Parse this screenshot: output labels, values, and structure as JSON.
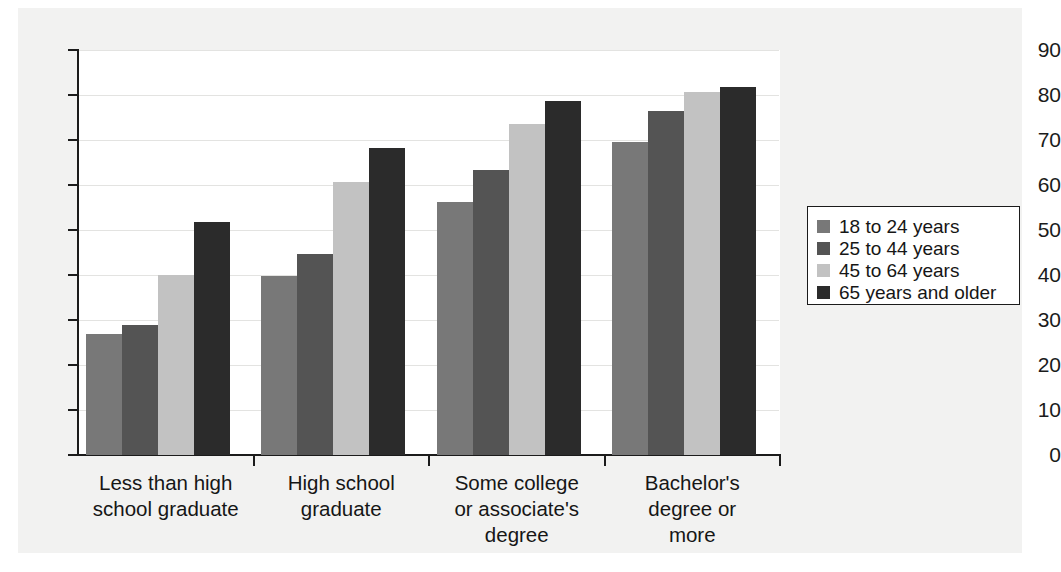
{
  "chart_data": {
    "type": "bar",
    "title": "",
    "subtitle": "",
    "xlabel": "",
    "ylabel": "",
    "ylim": [
      0,
      90
    ],
    "yticks": [
      0,
      10,
      20,
      30,
      40,
      50,
      60,
      70,
      80,
      90
    ],
    "ytick_labels": [
      "0",
      "10",
      "20",
      "30",
      "40",
      "50",
      "60",
      "70",
      "80",
      "90"
    ],
    "grid": true,
    "legend_position": "right",
    "categories": [
      "Less than high\nschool graduate",
      "High school\ngraduate",
      "Some college\nor associate's\ndegree",
      "Bachelor's\ndegree or\nmore"
    ],
    "category_lines": [
      [
        "Less than high",
        "school graduate"
      ],
      [
        "High school",
        "graduate"
      ],
      [
        "Some college",
        "or associate's",
        "degree"
      ],
      [
        "Bachelor's",
        "degree or",
        "more"
      ]
    ],
    "series": [
      {
        "name": "18 to 24 years",
        "color": "#787878",
        "values": [
          26.8,
          39.8,
          56.2,
          69.6
        ]
      },
      {
        "name": "25 to 44 years",
        "color": "#545454",
        "values": [
          29.0,
          44.7,
          63.3,
          76.5
        ]
      },
      {
        "name": "45 to 64 years",
        "color": "#c2c2c2",
        "values": [
          40.1,
          60.6,
          73.5,
          80.6
        ]
      },
      {
        "name": "65 years and older",
        "color": "#2b2b2b",
        "values": [
          51.7,
          68.2,
          78.7,
          81.7
        ]
      }
    ]
  },
  "legend": {
    "items": [
      {
        "label": "18 to 24 years",
        "color": "#787878"
      },
      {
        "label": "25 to 44 years",
        "color": "#545454"
      },
      {
        "label": "45 to 64 years",
        "color": "#c2c2c2"
      },
      {
        "label": "65 years and older",
        "color": "#2b2b2b"
      }
    ]
  },
  "colors": {
    "page_background": "#ffffff",
    "panel_background": "#f2f2f1",
    "plot_background": "#ffffff",
    "axis": "#1b1b1b",
    "gridline": "#e3e3e1",
    "text": "#161616"
  }
}
